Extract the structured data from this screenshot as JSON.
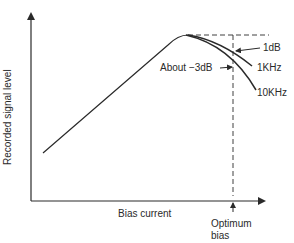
{
  "diagram": {
    "y_axis_label": "Recorded signal level",
    "x_axis_label": "Bias current",
    "marker_label_line1": "Optimum",
    "marker_label_line2": "bias",
    "annotations": {
      "minus_1db": "1dB",
      "about_minus_3db": "About −3dB",
      "curve_1khz": "1KHz",
      "curve_10khz": "10KHz"
    },
    "colors": {
      "line": "#2a2a2a",
      "background": "#ffffff"
    }
  }
}
